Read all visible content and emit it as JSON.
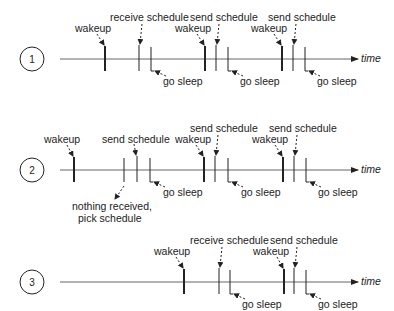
{
  "axis_label": "time",
  "labels": {
    "wakeup": "wakeup",
    "receive_schedule": "receive schedule",
    "send_schedule": "send schedule",
    "go_sleep": "go sleep",
    "nothing_received_1": "nothing received,",
    "nothing_received_2": "pick schedule"
  },
  "scenarios": [
    {
      "number": "1",
      "axis_y": 59
    },
    {
      "number": "2",
      "axis_y": 170
    },
    {
      "number": "3",
      "axis_y": 282
    }
  ],
  "colors": {
    "line": "#222222",
    "axis": "#555555",
    "text": "#222222"
  }
}
